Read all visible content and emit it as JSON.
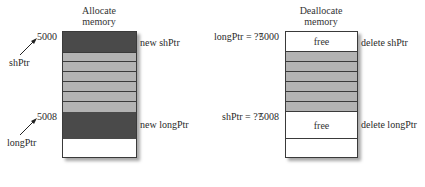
{
  "left_panel": {
    "title_line1": "Allocate",
    "title_line2": "memory",
    "addr_top": "5000",
    "addr_bottom": "5008",
    "ptr_top": "shPtr",
    "ptr_bottom": "longPtr",
    "op_top": "new shPtr",
    "op_bottom": "new longPtr",
    "colors": {
      "allocated": "#4a4a4a",
      "other": "#b3b3b3",
      "empty": "#ffffff"
    }
  },
  "right_panel": {
    "title_line1": "Deallocate",
    "title_line2": "memory",
    "addr_top": "5000",
    "addr_bottom": "5008",
    "ptr_top_label": "longPtr = ??",
    "ptr_bottom_label": "shPtr = ??",
    "cell_top": "free",
    "cell_bottom": "free",
    "op_top": "delete shPtr",
    "op_bottom": "delete longPtr"
  }
}
